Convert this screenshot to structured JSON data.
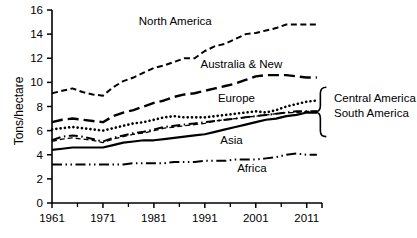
{
  "chart_data": {
    "type": "line",
    "title": "",
    "xlabel": "",
    "ylabel": "Tons/hectare",
    "xlim": [
      1961,
      2014
    ],
    "ylim": [
      0,
      16
    ],
    "ytick_labels": [
      "0",
      "2",
      "4",
      "6",
      "8",
      "10",
      "12",
      "14",
      "16"
    ],
    "ytick_values": [
      0,
      2,
      4,
      6,
      8,
      10,
      12,
      14,
      16
    ],
    "xtick_labels": [
      "1961",
      "1971",
      "1981",
      "1991",
      "2001",
      "2011"
    ],
    "xtick_values": [
      1961,
      1971,
      1981,
      1991,
      2001,
      2011
    ],
    "grid": false,
    "legend_position": "inline-annotations",
    "x": [
      1961,
      1963,
      1965,
      1967,
      1969,
      1971,
      1973,
      1975,
      1977,
      1979,
      1981,
      1983,
      1985,
      1987,
      1989,
      1991,
      1993,
      1995,
      1997,
      1999,
      2001,
      2003,
      2005,
      2007,
      2009,
      2011,
      2013
    ],
    "series": [
      {
        "name": "North America",
        "style": "dashed",
        "values": [
          9.1,
          9.3,
          9.5,
          9.2,
          9.0,
          8.9,
          9.6,
          10.1,
          10.4,
          10.8,
          11.2,
          11.4,
          11.7,
          12.0,
          12.0,
          12.6,
          13.0,
          13.2,
          13.6,
          14.0,
          14.1,
          14.3,
          14.5,
          14.8,
          14.8,
          14.8,
          14.8
        ]
      },
      {
        "name": "Australia & New",
        "style": "long-dash",
        "values": [
          6.7,
          6.9,
          7.0,
          6.9,
          6.8,
          6.7,
          7.2,
          7.5,
          7.7,
          8.0,
          8.3,
          8.5,
          8.8,
          9.0,
          9.1,
          9.3,
          9.5,
          9.7,
          9.9,
          10.2,
          10.5,
          10.6,
          10.6,
          10.6,
          10.5,
          10.4,
          10.4
        ]
      },
      {
        "name": "Europe",
        "style": "dotted",
        "values": [
          6.1,
          6.2,
          6.3,
          6.2,
          6.1,
          6.0,
          6.2,
          6.4,
          6.6,
          6.7,
          6.9,
          7.1,
          7.2,
          7.1,
          7.1,
          7.1,
          7.2,
          7.3,
          7.4,
          7.5,
          7.6,
          7.5,
          7.7,
          8.0,
          8.2,
          8.4,
          8.5
        ]
      },
      {
        "name": "Central America",
        "style": "dash-dot",
        "values": [
          5.2,
          5.5,
          5.6,
          5.5,
          5.3,
          5.1,
          5.4,
          5.6,
          5.8,
          5.9,
          6.1,
          6.3,
          6.4,
          6.5,
          6.6,
          6.7,
          6.8,
          6.9,
          7.0,
          7.1,
          7.2,
          7.3,
          7.4,
          7.5,
          7.6,
          7.6,
          7.6
        ]
      },
      {
        "name": "South America",
        "style": "thin-dash",
        "values": [
          5.1,
          5.3,
          5.4,
          5.3,
          5.2,
          5.0,
          5.3,
          5.5,
          5.7,
          5.8,
          6.0,
          6.2,
          6.3,
          6.4,
          6.5,
          6.6,
          6.8,
          6.9,
          7.0,
          7.1,
          7.2,
          7.3,
          7.4,
          7.5,
          7.5,
          7.6,
          7.6
        ]
      },
      {
        "name": "Asia",
        "style": "solid",
        "values": [
          4.4,
          4.5,
          4.6,
          4.6,
          4.6,
          4.6,
          4.8,
          5.0,
          5.1,
          5.2,
          5.2,
          5.3,
          5.4,
          5.5,
          5.6,
          5.7,
          5.9,
          6.1,
          6.3,
          6.5,
          6.7,
          6.9,
          7.0,
          7.2,
          7.3,
          7.5,
          7.5
        ]
      },
      {
        "name": "Africa",
        "style": "dash-dot-dot",
        "values": [
          3.2,
          3.2,
          3.2,
          3.2,
          3.2,
          3.2,
          3.2,
          3.2,
          3.3,
          3.3,
          3.3,
          3.3,
          3.4,
          3.4,
          3.4,
          3.5,
          3.5,
          3.5,
          3.6,
          3.6,
          3.6,
          3.7,
          3.8,
          4.0,
          4.1,
          4.0,
          4.0
        ]
      }
    ],
    "annotations": [
      {
        "text": "North America",
        "x": 1985,
        "y": 15.0
      },
      {
        "text": "Australia & New",
        "x": 1998,
        "y": 11.4
      },
      {
        "text": "Europe",
        "x": 1997,
        "y": 8.6
      },
      {
        "text": "Asia",
        "x": 1996,
        "y": 5.1
      },
      {
        "text": "Africa",
        "x": 2000,
        "y": 2.8
      },
      {
        "text": "Central America",
        "x": 2014,
        "y": 8.6
      },
      {
        "text": "South America",
        "x": 2014,
        "y": 7.4
      }
    ]
  },
  "axis": {
    "y_title": "Tons/hectare"
  }
}
